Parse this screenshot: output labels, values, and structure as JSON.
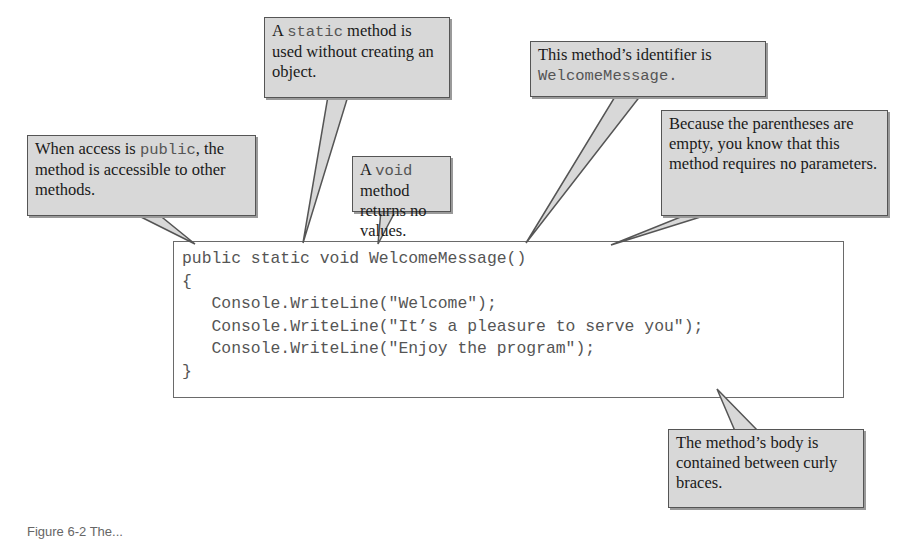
{
  "code": {
    "lines": [
      "public static void WelcomeMessage()",
      "{",
      "   Console.WriteLine(\"Welcome\");",
      "   Console.WriteLine(\"It’s a pleasure to serve you\");",
      "   Console.WriteLine(\"Enjoy the program\");",
      "}"
    ]
  },
  "callouts": {
    "static": {
      "pre": "A ",
      "code": "static",
      "post": " method is used without creating an object."
    },
    "public": {
      "pre": "When access is ",
      "code": "public",
      "post": ", the method is accessible to other methods."
    },
    "void": {
      "pre": "A ",
      "code": "void",
      "post": " method returns no values."
    },
    "identifier": {
      "pre": "This method’s identifier is ",
      "code": "WelcomeMessage",
      "post": "."
    },
    "parentheses": {
      "text": "Because the parentheses are empty, you know that this method requires no parameters."
    },
    "body": {
      "text": "The method’s body is contained between curly braces."
    }
  },
  "caption": {
    "text": "Figure 6-2 The..."
  },
  "colors": {
    "callout_fill": "#d8d8d8",
    "callout_border": "#555555",
    "code_text": "#555555"
  }
}
